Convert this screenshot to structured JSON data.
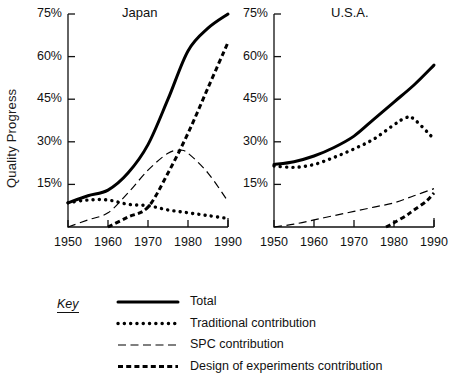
{
  "figure": {
    "ylabel": "Quality Progress",
    "panels": [
      {
        "title": "Japan"
      },
      {
        "title": "U.S.A."
      }
    ],
    "key_label": "Key"
  },
  "chart_data": {
    "type": "line",
    "title": "Quality Progress",
    "xlabel": "",
    "ylabel": "Quality Progress",
    "xlim": [
      1950,
      1990
    ],
    "ylim": [
      0,
      75
    ],
    "yticks": [
      15,
      30,
      45,
      60,
      75
    ],
    "ytick_labels": [
      "15%",
      "30%",
      "45%",
      "60%",
      "75%"
    ],
    "xticks": [
      1950,
      1960,
      1970,
      1980,
      1990
    ],
    "xtick_labels": [
      "1950",
      "1960",
      "1970",
      "1980",
      "1990"
    ],
    "grid": false,
    "legend_position": "below",
    "legend": [
      {
        "name": "Total",
        "style": "solid-thick"
      },
      {
        "name": "Traditional contribution",
        "style": "dotted"
      },
      {
        "name": "SPC contribution",
        "style": "long-dash"
      },
      {
        "name": "Design of experiments contribution",
        "style": "short-dash-thick"
      }
    ],
    "panels": [
      {
        "name": "Japan",
        "series": [
          {
            "name": "Total",
            "style": "solid-thick",
            "x": [
              1950,
              1955,
              1960,
              1965,
              1970,
              1975,
              1980,
              1985,
              1990
            ],
            "y": [
              8.5,
              11,
              13,
              19,
              29,
              45,
              62,
              70,
              75
            ]
          },
          {
            "name": "Traditional contribution",
            "style": "dotted",
            "x": [
              1950,
              1955,
              1960,
              1965,
              1970,
              1975,
              1980,
              1985,
              1990
            ],
            "y": [
              8.5,
              9.5,
              9.5,
              8,
              7.5,
              6,
              5,
              4,
              3
            ]
          },
          {
            "name": "SPC contribution",
            "style": "long-dash",
            "x": [
              1950,
              1955,
              1960,
              1965,
              1970,
              1975,
              1978,
              1980,
              1985,
              1990
            ],
            "y": [
              0,
              2.5,
              5,
              12,
              20,
              26,
              27,
              26,
              19,
              9
            ]
          },
          {
            "name": "Design of experiments contribution",
            "style": "short-dash-thick",
            "x": [
              1960,
              1965,
              1970,
              1975,
              1980,
              1985,
              1990
            ],
            "y": [
              0,
              3.5,
              7,
              19,
              33,
              49,
              65
            ]
          }
        ]
      },
      {
        "name": "U.S.A.",
        "series": [
          {
            "name": "Total",
            "style": "solid-thick",
            "x": [
              1950,
              1955,
              1960,
              1965,
              1970,
              1975,
              1980,
              1985,
              1990
            ],
            "y": [
              22,
              23,
              25,
              28,
              32,
              38,
              44,
              50,
              57
            ]
          },
          {
            "name": "Traditional contribution",
            "style": "dotted",
            "x": [
              1950,
              1955,
              1960,
              1965,
              1970,
              1975,
              1980,
              1983,
              1985,
              1990
            ],
            "y": [
              21.5,
              21,
              22,
              24.5,
              27.5,
              31,
              36,
              38.5,
              38,
              31
            ]
          },
          {
            "name": "SPC contribution",
            "style": "long-dash",
            "x": [
              1950,
              1955,
              1960,
              1965,
              1970,
              1975,
              1980,
              1985,
              1990
            ],
            "y": [
              0,
              1,
              2.5,
              4,
              5.5,
              7,
              8.5,
              11,
              13.5
            ]
          },
          {
            "name": "Design of experiments contribution",
            "style": "short-dash-thick",
            "x": [
              1978,
              1980,
              1983,
              1985,
              1988,
              1990
            ],
            "y": [
              0,
              1.5,
              4,
              6,
              9,
              12
            ]
          }
        ]
      }
    ]
  }
}
